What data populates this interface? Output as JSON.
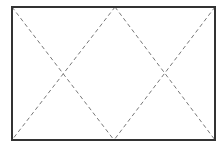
{
  "diagram": {
    "type": "rectangle-with-dashed-diagonals",
    "canvas": {
      "width": 220,
      "height": 149,
      "background": "#ffffff"
    },
    "rectangle": {
      "x": 12,
      "y": 7,
      "width": 203,
      "height": 133,
      "stroke": "#333333",
      "stroke_width": 2
    },
    "dashed_lines": [
      {
        "name": "top-left-to-bottom-mid",
        "x1": 12,
        "y1": 7,
        "x2": 114,
        "y2": 140
      },
      {
        "name": "top-mid-to-bottom-left",
        "x1": 115,
        "y1": 7,
        "x2": 12,
        "y2": 140
      },
      {
        "name": "top-mid-to-bottom-right",
        "x1": 115,
        "y1": 7,
        "x2": 215,
        "y2": 140
      },
      {
        "name": "top-right-to-bottom-mid",
        "x1": 215,
        "y1": 7,
        "x2": 114,
        "y2": 140
      }
    ],
    "dash_style": {
      "stroke": "#777777",
      "stroke_width": 1,
      "dasharray": "4 3"
    },
    "labels": []
  }
}
